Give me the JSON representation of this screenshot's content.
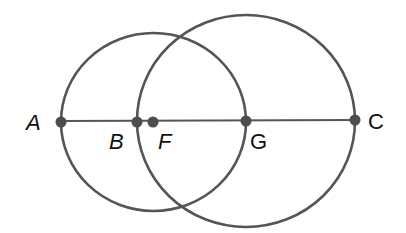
{
  "diagram": {
    "colors": {
      "stroke": "#555555",
      "point": "#4d4d4d",
      "label": "#111111",
      "background": "#ffffff"
    },
    "segment": {
      "from": "A",
      "to": "C",
      "x1": 61,
      "y1": 121,
      "x2": 355,
      "y2": 120
    },
    "circles": [
      {
        "name": "circle-centered-F",
        "center": "F",
        "cx": 153.5,
        "cy": 122,
        "rx": 92.5,
        "ry": 89,
        "passes_through": [
          "A",
          "G"
        ]
      },
      {
        "name": "circle-centered-G",
        "center": "G",
        "cx": 246,
        "cy": 121,
        "rx": 109,
        "ry": 106,
        "passes_through": [
          "B",
          "C"
        ]
      }
    ],
    "points": [
      {
        "id": "A",
        "x": 61,
        "y": 122,
        "label": "A",
        "lx": 26,
        "ly": 130,
        "italic": true
      },
      {
        "id": "B",
        "x": 137,
        "y": 122,
        "label": "B",
        "lx": 109,
        "ly": 149,
        "italic": true
      },
      {
        "id": "F",
        "x": 153,
        "y": 122,
        "label": "F",
        "lx": 158,
        "ly": 149,
        "italic": true
      },
      {
        "id": "G",
        "x": 246,
        "y": 121,
        "label": "G",
        "lx": 250,
        "ly": 149,
        "italic": false
      },
      {
        "id": "C",
        "x": 355,
        "y": 120,
        "label": "C",
        "lx": 368,
        "ly": 129,
        "italic": false
      }
    ]
  }
}
